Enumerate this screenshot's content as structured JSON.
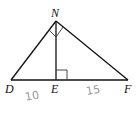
{
  "diagram": {
    "type": "right-triangle-with-altitude",
    "vertices": {
      "N": {
        "label": "N",
        "x": 56,
        "y": 21
      },
      "D": {
        "label": "D",
        "x": 11,
        "y": 80
      },
      "E": {
        "label": "E",
        "x": 56,
        "y": 80
      },
      "F": {
        "label": "F",
        "x": 128,
        "y": 80
      }
    },
    "segments": [
      "ND",
      "NF",
      "NE",
      "DF"
    ],
    "right_angles": [
      "DNF",
      "NED"
    ],
    "measurements": {
      "DE": "10",
      "EF": "15"
    },
    "colors": {
      "line": "#111111",
      "handwriting": "#9a9a9a"
    }
  }
}
